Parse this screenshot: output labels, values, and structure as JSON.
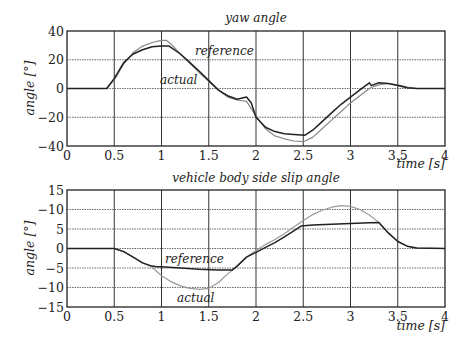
{
  "chart_data": [
    {
      "type": "line",
      "title": "yaw angle",
      "xlabel": "time [s]",
      "ylabel": "angle [°]",
      "xlim": [
        0,
        4
      ],
      "ylim": [
        -40,
        40
      ],
      "xticks": [
        "0",
        "0.5",
        "1",
        "1.5",
        "2",
        "2.5",
        "3",
        "3.5",
        "4"
      ],
      "yticks": [
        "40",
        "20",
        "0",
        "−20",
        "−40"
      ],
      "grid": true,
      "annotations": [
        {
          "text": "reference",
          "x": 1.4,
          "y": 20
        },
        {
          "text": "actual",
          "x": 1.1,
          "y": 7
        }
      ],
      "series": [
        {
          "name": "reference",
          "color": "#888888",
          "x": [
            0,
            0.42,
            0.5,
            0.6,
            0.7,
            0.8,
            0.9,
            1.0,
            1.05,
            1.1,
            1.2,
            1.3,
            1.4,
            1.5,
            1.6,
            1.7,
            1.8,
            1.9,
            2.0,
            2.1,
            2.2,
            2.3,
            2.4,
            2.5,
            2.6,
            2.7,
            2.8,
            2.9,
            3.0,
            3.1,
            3.2,
            3.25,
            3.3,
            3.4,
            3.5,
            3.6,
            3.7,
            4.0
          ],
          "y": [
            0,
            0,
            6,
            17,
            25,
            29.5,
            32,
            33.5,
            33.5,
            31,
            24,
            17.5,
            11,
            5,
            -1,
            -6,
            -8,
            -9,
            -19,
            -28,
            -33,
            -35,
            -36.5,
            -37,
            -34,
            -28,
            -22,
            -16,
            -10,
            -5,
            0,
            1.5,
            2.5,
            3.5,
            2.5,
            1,
            0,
            0
          ]
        },
        {
          "name": "actual",
          "color": "#222222",
          "x": [
            0,
            0.42,
            0.5,
            0.6,
            0.7,
            0.8,
            0.9,
            1.0,
            1.08,
            1.2,
            1.3,
            1.4,
            1.5,
            1.6,
            1.65,
            1.7,
            1.8,
            1.9,
            1.95,
            2.0,
            2.1,
            2.2,
            2.3,
            2.4,
            2.52,
            2.6,
            2.7,
            2.8,
            2.9,
            3.0,
            3.1,
            3.2,
            3.22,
            3.24,
            3.3,
            3.4,
            3.5,
            3.6,
            3.7,
            4.0
          ],
          "y": [
            0,
            0,
            7,
            18,
            24,
            27,
            29,
            29.5,
            29.5,
            24,
            18,
            12,
            5.5,
            -1,
            -3,
            -5,
            -7.5,
            -6,
            -10,
            -20,
            -27,
            -30,
            -31.5,
            -32,
            -32.5,
            -29,
            -23,
            -17,
            -11,
            -6,
            -1,
            4,
            2,
            2.5,
            4,
            3.5,
            2,
            0.5,
            0,
            0
          ]
        }
      ]
    },
    {
      "type": "line",
      "title": "vehicle body side slip angle",
      "xlabel": "time [s]",
      "ylabel": "angle [°]",
      "xlim": [
        0,
        4
      ],
      "ylim": [
        -15,
        15
      ],
      "xticks": [
        "0",
        "0.5",
        "1",
        "1.5",
        "2",
        "2.5",
        "3",
        "3.5",
        "4"
      ],
      "yticks": [
        "15",
        "−10",
        "5",
        "0",
        "−5",
        "−10",
        "−15"
      ],
      "grid": true,
      "annotations": [
        {
          "text": "reference",
          "x": 1.35,
          "y": -3
        },
        {
          "text": "actual",
          "x": 1.4,
          "y": -13
        }
      ],
      "series": [
        {
          "name": "reference",
          "color": "#999999",
          "x": [
            0,
            0.4,
            0.5,
            0.6,
            0.7,
            0.8,
            0.9,
            1.0,
            1.1,
            1.2,
            1.3,
            1.4,
            1.5,
            1.6,
            1.7,
            1.8,
            1.9,
            2.0,
            2.1,
            2.2,
            2.3,
            2.4,
            2.5,
            2.6,
            2.7,
            2.8,
            2.9,
            3.0,
            3.1,
            3.2,
            3.3,
            3.4,
            3.5,
            3.6,
            3.7,
            4.0
          ],
          "y": [
            0,
            0,
            0,
            -0.8,
            -2.2,
            -3.7,
            -4.8,
            -7,
            -8.5,
            -9.6,
            -10.2,
            -10.5,
            -10.2,
            -8.8,
            -6.5,
            -4.5,
            -2.2,
            -0.5,
            1,
            2.3,
            3.8,
            5.5,
            7.2,
            8.7,
            9.8,
            10.6,
            11,
            10.8,
            10,
            8.6,
            6.7,
            4,
            1.8,
            0.6,
            0.1,
            0
          ]
        },
        {
          "name": "actual",
          "color": "#222222",
          "x": [
            0,
            0.4,
            0.5,
            0.6,
            0.7,
            0.8,
            0.9,
            0.95,
            1.0,
            1.2,
            1.4,
            1.6,
            1.75,
            1.8,
            1.9,
            2.0,
            2.1,
            2.2,
            2.3,
            2.4,
            2.48,
            2.6,
            2.8,
            3.0,
            3.2,
            3.3,
            3.4,
            3.5,
            3.6,
            3.7,
            4.0
          ],
          "y": [
            0,
            0,
            0,
            -0.8,
            -2.2,
            -3.7,
            -4.5,
            -4.7,
            -4.7,
            -5,
            -5.3,
            -5.5,
            -5.5,
            -4.5,
            -2.2,
            -1,
            0.3,
            1.5,
            3,
            4.5,
            5.8,
            6,
            6.2,
            6.4,
            6.6,
            6.7,
            4,
            1.8,
            0.6,
            0.1,
            0
          ]
        }
      ]
    }
  ]
}
